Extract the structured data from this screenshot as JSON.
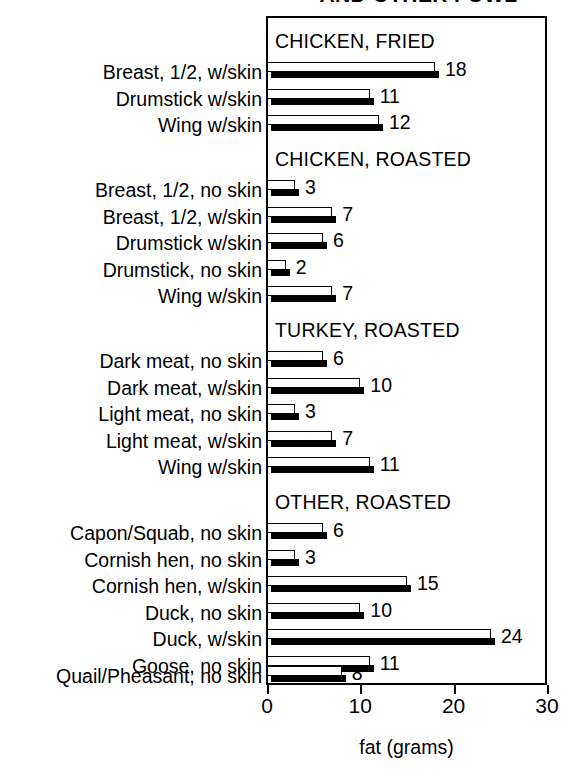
{
  "chart_data": {
    "type": "bar",
    "title": "AND OTHER FOWL",
    "xlabel": "fat (grams)",
    "ylabel": "",
    "orientation": "horizontal",
    "xlim": [
      0,
      30
    ],
    "xticks": [
      0,
      10,
      20,
      30
    ],
    "xticklabels": [
      "0",
      "10",
      "20",
      "30"
    ],
    "grid": false,
    "legend": "none",
    "style": "3d-shadow-bar",
    "sections": [
      {
        "header": "CHICKEN, FRIED",
        "categories": [
          "Breast, 1/2, w/skin",
          "Drumstick w/skin",
          "Wing w/skin"
        ],
        "values": [
          18,
          11,
          12
        ]
      },
      {
        "header": "CHICKEN, ROASTED",
        "categories": [
          "Breast, 1/2, no skin",
          "Breast, 1/2, w/skin",
          "Drumstick w/skin",
          "Drumstick, no skin",
          "Wing w/skin"
        ],
        "values": [
          3,
          7,
          6,
          2,
          7
        ]
      },
      {
        "header": "TURKEY, ROASTED",
        "categories": [
          "Dark meat, no skin",
          "Dark meat, w/skin",
          "Light meat, no skin",
          "Light meat, w/skin",
          "Wing w/skin"
        ],
        "values": [
          6,
          10,
          3,
          7,
          11
        ]
      },
      {
        "header": "OTHER, ROASTED",
        "categories": [
          "Capon/Squab, no skin",
          "Cornish hen, no skin",
          "Cornish hen, w/skin",
          "Duck, no skin",
          "Duck, w/skin",
          "Goose, no skin",
          "Quail/Pheasant, no skin"
        ],
        "values": [
          6,
          3,
          15,
          10,
          11,
          8
        ]
      }
    ],
    "categories": [
      "Breast, 1/2, w/skin",
      "Drumstick w/skin",
      "Wing w/skin",
      "Breast, 1/2, no skin",
      "Breast, 1/2, w/skin",
      "Drumstick w/skin",
      "Drumstick, no skin",
      "Wing w/skin",
      "Dark meat, no skin",
      "Dark meat, w/skin",
      "Light meat, no skin",
      "Light meat, w/skin",
      "Wing w/skin",
      "Capon/Squab, no skin",
      "Cornish hen, no skin",
      "Cornish hen, w/skin",
      "Duck, no skin",
      "Duck, w/skin",
      "Goose, no skin",
      "Quail/Pheasant, no skin"
    ],
    "values": [
      18,
      11,
      12,
      3,
      7,
      6,
      2,
      7,
      6,
      10,
      3,
      7,
      11,
      6,
      3,
      15,
      10,
      24,
      11,
      8
    ],
    "colors": {
      "bar_top": "#ffffff",
      "bar_front": "#000000",
      "outline": "#000000",
      "background": "#ffffff"
    }
  },
  "layout": {
    "plot_left": 266,
    "plot_top": 16,
    "plot_width": 281,
    "plot_height": 669,
    "x_zero_px": 267,
    "px_per_unit": 9.33,
    "rows": [
      {
        "y": 62,
        "kind": "bar",
        "value": 18,
        "label": "Breast, 1/2, w/skin"
      },
      {
        "y": 89,
        "kind": "bar",
        "value": 11,
        "label": "Drumstick w/skin"
      },
      {
        "y": 115,
        "kind": "bar",
        "value": 12,
        "label": "Wing w/skin"
      },
      {
        "y": 180,
        "kind": "bar",
        "value": 3,
        "label": "Breast, 1/2, no skin"
      },
      {
        "y": 207,
        "kind": "bar",
        "value": 7,
        "label": "Breast, 1/2, w/skin"
      },
      {
        "y": 233,
        "kind": "bar",
        "value": 6,
        "label": "Drumstick w/skin"
      },
      {
        "y": 260,
        "kind": "bar",
        "value": 2,
        "label": "Drumstick, no skin"
      },
      {
        "y": 286,
        "kind": "bar",
        "value": 7,
        "label": "Wing w/skin"
      },
      {
        "y": 351,
        "kind": "bar",
        "value": 6,
        "label": "Dark meat, no skin"
      },
      {
        "y": 378,
        "kind": "bar",
        "value": 10,
        "label": "Dark meat, w/skin"
      },
      {
        "y": 404,
        "kind": "bar",
        "value": 3,
        "label": "Light meat, no skin"
      },
      {
        "y": 431,
        "kind": "bar",
        "value": 7,
        "label": "Light meat, w/skin"
      },
      {
        "y": 457,
        "kind": "bar",
        "value": 11,
        "label": "Wing w/skin"
      },
      {
        "y": 523,
        "kind": "bar",
        "value": 6,
        "label": "Capon/Squab, no skin"
      },
      {
        "y": 550,
        "kind": "bar",
        "value": 3,
        "label": "Cornish hen, no skin"
      },
      {
        "y": 576,
        "kind": "bar",
        "value": 15,
        "label": "Cornish hen, w/skin"
      },
      {
        "y": 603,
        "kind": "bar",
        "value": 10,
        "label": "Duck, no skin"
      },
      {
        "y": 629,
        "kind": "bar",
        "value": 24,
        "label": "Duck, w/skin"
      },
      {
        "y": 656,
        "kind": "bar",
        "value": 11,
        "label": "Goose, no skin"
      },
      {
        "y": 666,
        "kind": "bar",
        "value": 8,
        "label": "Quail/Pheasant, no skin"
      }
    ],
    "headers": [
      {
        "y": 32,
        "text": "CHICKEN, FRIED"
      },
      {
        "y": 150,
        "text": "CHICKEN, ROASTED"
      },
      {
        "y": 321,
        "text": "TURKEY, ROASTED"
      },
      {
        "y": 493,
        "text": "OTHER, ROASTED"
      }
    ]
  }
}
